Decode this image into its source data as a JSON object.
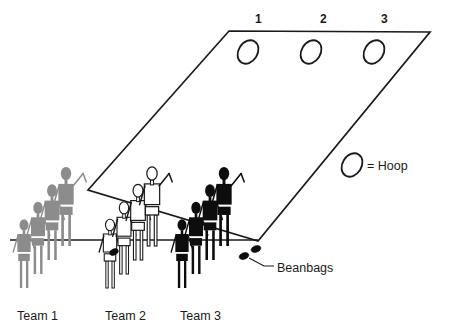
{
  "diagram": {
    "court": {
      "name": "playing-area",
      "shape": "parallelogram",
      "outline_color": "#1a1a1a",
      "corners": [
        [
          88,
          190
        ],
        [
          229,
          31
        ],
        [
          430,
          32
        ],
        [
          258,
          241
        ]
      ]
    },
    "hoops": [
      {
        "label": "1",
        "cx": 248,
        "cy": 52,
        "num_x": 255,
        "num_y": 13
      },
      {
        "label": "2",
        "cx": 311,
        "cy": 52,
        "num_x": 320,
        "num_y": 13
      },
      {
        "label": "3",
        "cx": 374,
        "cy": 52,
        "num_x": 381,
        "num_y": 13
      }
    ],
    "legend": {
      "hoop_symbol_cx": 352,
      "hoop_symbol_cy": 165,
      "equals_label": "= Hoop",
      "equals_x": 367,
      "equals_y": 160
    },
    "callouts": [
      {
        "name": "beanbags-callout",
        "label": "Beanbags",
        "x": 277,
        "y": 262
      }
    ],
    "teams": [
      {
        "id": "team-1",
        "label": "Team 1",
        "label_x": 17,
        "label_y": 310,
        "color": "#8c8c8c",
        "fill": "#8c8c8c",
        "stroke": "#8c8c8c",
        "filled": true,
        "members": 4,
        "base_x": 24,
        "base_y": 288,
        "step_x": 14,
        "step_y": -14,
        "scale": 1.0
      },
      {
        "id": "team-2",
        "label": "Team 2",
        "label_x": 105,
        "label_y": 310,
        "color": "#1a1a1a",
        "fill": "#ffffff",
        "stroke": "#1a1a1a",
        "filled": false,
        "members": 4,
        "base_x": 110,
        "base_y": 288,
        "step_x": 14,
        "step_y": -14,
        "scale": 1.0
      },
      {
        "id": "team-3",
        "label": "Team 3",
        "label_x": 180,
        "label_y": 310,
        "color": "#0d0d0d",
        "fill": "#0d0d0d",
        "stroke": "#0d0d0d",
        "filled": true,
        "members": 4,
        "base_x": 182,
        "base_y": 288,
        "step_x": 14,
        "step_y": -14,
        "scale": 1.0
      }
    ],
    "beanbags": [
      {
        "cx": 256,
        "cy": 249,
        "rx": 5,
        "ry": 3.2,
        "rot": -20
      },
      {
        "cx": 244,
        "cy": 256,
        "rx": 5,
        "ry": 3.2,
        "rot": -20
      },
      {
        "cx": 114,
        "cy": 252,
        "rx": 4.5,
        "ry": 3.0,
        "rot": -25
      }
    ],
    "throw_line": {
      "x1": 10,
      "y1": 240,
      "x2": 258,
      "y2": 240
    },
    "colors": {
      "ink": "#1a1a1a",
      "gray": "#8c8c8c",
      "black": "#0d0d0d",
      "white": "#ffffff",
      "background": "#ffffff"
    }
  }
}
